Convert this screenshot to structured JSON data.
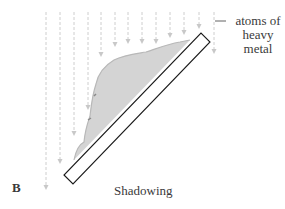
{
  "figure": {
    "panel_label": "B",
    "caption": "Shadowing",
    "annotation": {
      "line1": "atoms of",
      "line2": "heavy",
      "line3": "metal"
    },
    "colors": {
      "arrow": "#c8c8c8",
      "specimen_fill": "#d4d4d4",
      "metal_coat": "#a8a8a8",
      "slide_stroke": "#1a1a1a",
      "text": "#3a3a3a"
    },
    "arrows": [
      {
        "x": 46,
        "y1": 12,
        "y2": 190
      },
      {
        "x": 60,
        "y1": 12,
        "y2": 164
      },
      {
        "x": 74,
        "y1": 12,
        "y2": 136
      },
      {
        "x": 88,
        "y1": 12,
        "y2": 110
      },
      {
        "x": 101,
        "y1": 12,
        "y2": 57
      },
      {
        "x": 115,
        "y1": 12,
        "y2": 47
      },
      {
        "x": 128,
        "y1": 12,
        "y2": 44
      },
      {
        "x": 142,
        "y1": 12,
        "y2": 44
      },
      {
        "x": 156,
        "y1": 12,
        "y2": 44
      },
      {
        "x": 170,
        "y1": 12,
        "y2": 38
      },
      {
        "x": 184,
        "y1": 12,
        "y2": 35
      },
      {
        "x": 199,
        "y1": 12,
        "y2": 29
      },
      {
        "x": 214,
        "y1": 12,
        "y2": 54
      }
    ]
  }
}
